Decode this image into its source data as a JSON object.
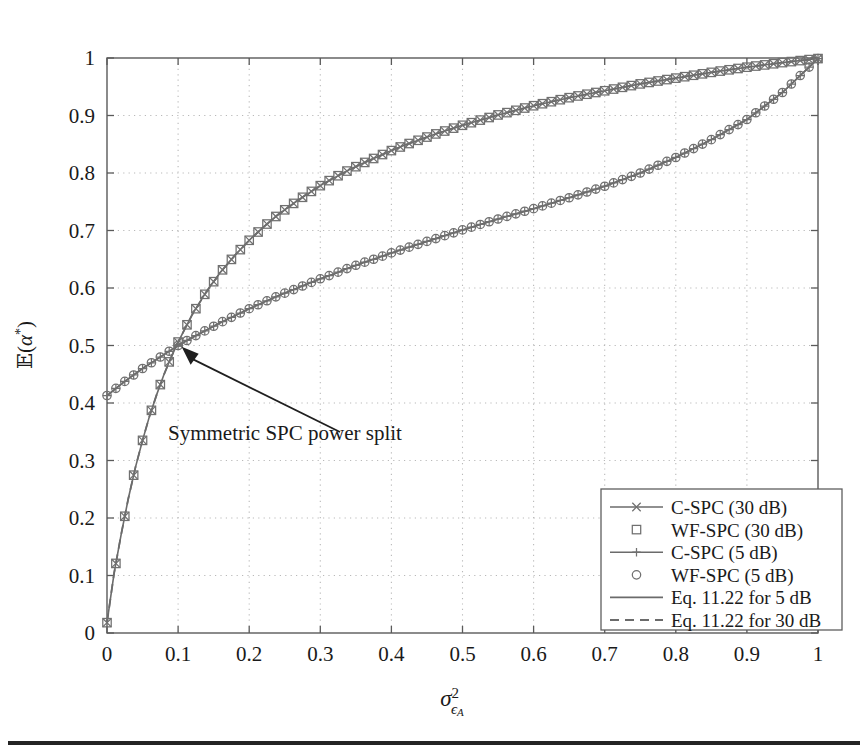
{
  "figure": {
    "background": "#ffffff",
    "plot_frame_color": "#5a5a5a",
    "curve_color": "#6b6b6b",
    "annotation": {
      "text": "Symmetric SPC power split",
      "points_to_x": 0.105,
      "points_to_y": 0.505
    },
    "bottom_rule_color": "#242424"
  },
  "chart_data": {
    "type": "line",
    "title": "",
    "xlabel": "σ²ϵA",
    "ylabel": "𝔼(α*)",
    "xlim": [
      0,
      1
    ],
    "ylim": [
      0,
      1
    ],
    "xticks": [
      0,
      0.1,
      0.2,
      0.3,
      0.4,
      0.5,
      0.6,
      0.7,
      0.8,
      0.9,
      1
    ],
    "yticks": [
      0,
      0.1,
      0.2,
      0.3,
      0.4,
      0.5,
      0.6,
      0.7,
      0.8,
      0.9,
      1
    ],
    "xticklabels": [
      "0",
      "0.1",
      "0.2",
      "0.3",
      "0.4",
      "0.5",
      "0.6",
      "0.7",
      "0.8",
      "0.9",
      "1"
    ],
    "yticklabels": [
      "0",
      "0.1",
      "0.2",
      "0.3",
      "0.4",
      "0.5",
      "0.6",
      "0.7",
      "0.8",
      "0.9",
      "1"
    ],
    "grid": true,
    "grid_style": "dotted",
    "legend_position": "lower right",
    "x": [
      0,
      0.01,
      0.02,
      0.03,
      0.04,
      0.05,
      0.06,
      0.07,
      0.08,
      0.09,
      0.1,
      0.12,
      0.14,
      0.16,
      0.18,
      0.2,
      0.22,
      0.24,
      0.26,
      0.28,
      0.3,
      0.32,
      0.34,
      0.36,
      0.38,
      0.4,
      0.42,
      0.44,
      0.46,
      0.48,
      0.5,
      0.55,
      0.6,
      0.65,
      0.7,
      0.75,
      0.8,
      0.85,
      0.9,
      0.95,
      1
    ],
    "series": [
      {
        "name": "C-SPC (30 dB)",
        "marker": "x",
        "linestyle": "solid",
        "snr_db": 30,
        "values": [
          0.018,
          0.104,
          0.172,
          0.234,
          0.288,
          0.335,
          0.378,
          0.415,
          0.449,
          0.479,
          0.506,
          0.554,
          0.594,
          0.628,
          0.657,
          0.683,
          0.706,
          0.727,
          0.745,
          0.762,
          0.778,
          0.792,
          0.805,
          0.817,
          0.828,
          0.839,
          0.849,
          0.858,
          0.867,
          0.875,
          0.883,
          0.901,
          0.917,
          0.931,
          0.943,
          0.955,
          0.965,
          0.975,
          0.984,
          0.992,
          0.999
        ]
      },
      {
        "name": "WF-SPC (30 dB)",
        "marker": "square",
        "linestyle": "none",
        "snr_db": 30,
        "values": [
          0.018,
          0.104,
          0.172,
          0.234,
          0.288,
          0.335,
          0.378,
          0.415,
          0.449,
          0.479,
          0.506,
          0.554,
          0.594,
          0.628,
          0.657,
          0.683,
          0.706,
          0.727,
          0.745,
          0.762,
          0.778,
          0.792,
          0.805,
          0.817,
          0.828,
          0.839,
          0.849,
          0.858,
          0.867,
          0.875,
          0.883,
          0.901,
          0.917,
          0.931,
          0.943,
          0.955,
          0.965,
          0.975,
          0.984,
          0.992,
          0.999
        ]
      },
      {
        "name": "C-SPC (5 dB)",
        "marker": "plus",
        "linestyle": "solid",
        "snr_db": 5,
        "values": [
          0.413,
          0.423,
          0.433,
          0.442,
          0.451,
          0.46,
          0.468,
          0.476,
          0.484,
          0.492,
          0.5,
          0.514,
          0.527,
          0.54,
          0.552,
          0.564,
          0.575,
          0.586,
          0.596,
          0.606,
          0.616,
          0.625,
          0.635,
          0.644,
          0.652,
          0.661,
          0.669,
          0.677,
          0.685,
          0.693,
          0.701,
          0.72,
          0.738,
          0.757,
          0.777,
          0.8,
          0.827,
          0.858,
          0.893,
          0.94,
          0.999
        ]
      },
      {
        "name": "WF-SPC (5 dB)",
        "marker": "circle",
        "linestyle": "none",
        "snr_db": 5,
        "values": [
          0.413,
          0.423,
          0.433,
          0.442,
          0.451,
          0.46,
          0.468,
          0.476,
          0.484,
          0.492,
          0.5,
          0.514,
          0.527,
          0.54,
          0.552,
          0.564,
          0.575,
          0.586,
          0.596,
          0.606,
          0.616,
          0.625,
          0.635,
          0.644,
          0.652,
          0.661,
          0.669,
          0.677,
          0.685,
          0.693,
          0.701,
          0.72,
          0.738,
          0.757,
          0.777,
          0.8,
          0.827,
          0.858,
          0.893,
          0.94,
          0.999
        ]
      },
      {
        "name": "Eq. 11.22 for 5 dB",
        "marker": "none",
        "linestyle": "solid",
        "snr_db": 5,
        "values": [
          0.413,
          0.423,
          0.433,
          0.442,
          0.451,
          0.46,
          0.468,
          0.476,
          0.484,
          0.492,
          0.5,
          0.514,
          0.527,
          0.54,
          0.552,
          0.564,
          0.575,
          0.586,
          0.596,
          0.606,
          0.616,
          0.625,
          0.635,
          0.644,
          0.652,
          0.661,
          0.669,
          0.677,
          0.685,
          0.693,
          0.701,
          0.72,
          0.738,
          0.757,
          0.777,
          0.8,
          0.827,
          0.858,
          0.893,
          0.94,
          0.999
        ]
      },
      {
        "name": "Eq. 11.22 for 30 dB",
        "marker": "none",
        "linestyle": "dashed",
        "snr_db": 30,
        "values": [
          0.018,
          0.104,
          0.172,
          0.234,
          0.288,
          0.335,
          0.378,
          0.415,
          0.449,
          0.479,
          0.506,
          0.554,
          0.594,
          0.628,
          0.657,
          0.683,
          0.706,
          0.727,
          0.745,
          0.762,
          0.778,
          0.792,
          0.805,
          0.817,
          0.828,
          0.839,
          0.849,
          0.858,
          0.867,
          0.875,
          0.883,
          0.901,
          0.917,
          0.931,
          0.943,
          0.955,
          0.965,
          0.975,
          0.984,
          0.992,
          0.999
        ]
      }
    ],
    "legend_entries": [
      {
        "label": "C-SPC (30 dB)",
        "sample": "line-x"
      },
      {
        "label": "WF-SPC (30 dB)",
        "sample": "square"
      },
      {
        "label": "C-SPC (5 dB)",
        "sample": "line-plus"
      },
      {
        "label": "WF-SPC (5 dB)",
        "sample": "circle"
      },
      {
        "label": "Eq. 11.22 for 5 dB",
        "sample": "line-solid"
      },
      {
        "label": "Eq. 11.22 for 30 dB",
        "sample": "line-dashed"
      }
    ]
  }
}
